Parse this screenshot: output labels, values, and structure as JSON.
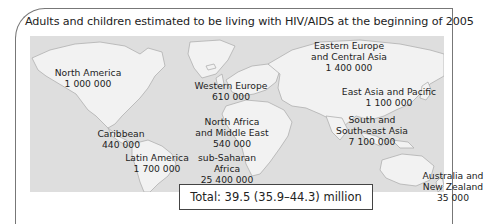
{
  "title": "Adults and children estimated to be living with HIV/AIDS at the beginning of 2005",
  "regions": [
    {
      "name": "North America",
      "value": "1 000 000",
      "x": 88,
      "y": 67
    },
    {
      "name": "Western Europe",
      "value": "610 000",
      "x": 231,
      "y": 80
    },
    {
      "name": "Eastern Europe\nand Central Asia",
      "value": "1 400 000",
      "x": 349,
      "y": 40
    },
    {
      "name": "East Asia and Pacific",
      "value": "1 100 000",
      "x": 389,
      "y": 86
    },
    {
      "name": "Caribbean",
      "value": "440 000",
      "x": 121,
      "y": 128
    },
    {
      "name": "North Africa\nand Middle East",
      "value": "540 000",
      "x": 232,
      "y": 116
    },
    {
      "name": "South and\nSouth-east Asia",
      "value": "7 100 000",
      "x": 372,
      "y": 114
    },
    {
      "name": "Latin America",
      "value": "1 700 000",
      "x": 157,
      "y": 152
    },
    {
      "name": "sub-Saharan\nAfrica",
      "value": "25 400 000",
      "x": 227,
      "y": 152
    },
    {
      "name": "Australia and\nNew Zealand",
      "value": "35 000",
      "x": 453,
      "y": 170
    }
  ],
  "total": {
    "label": "Total: 39.5 (35.9–44.3) million"
  },
  "colors": {
    "ocean": "#dedede",
    "land": "#f2f2f2",
    "coast": "#b0b0b0",
    "frame": "#777777"
  }
}
